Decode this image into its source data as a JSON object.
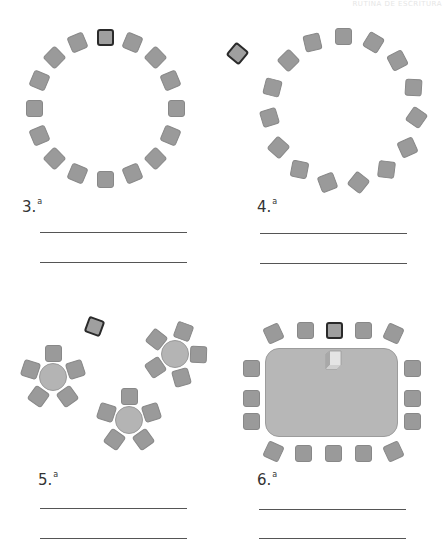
{
  "header": {
    "text": "RUTINA DE ESCRITURA"
  },
  "exercises": [
    {
      "id": "ex3",
      "number": "3.",
      "suffix": "a",
      "arrangement": "circle",
      "seat_count": 16,
      "highlighted_seat": "top"
    },
    {
      "id": "ex4",
      "number": "4.",
      "suffix": "a",
      "arrangement": "circle",
      "seat_count": 15,
      "highlighted_seat": "outside-top-left"
    },
    {
      "id": "ex5",
      "number": "5.",
      "suffix": "a",
      "arrangement": "three-round-tables",
      "seat_count": 15,
      "highlighted_seat": "outside-top"
    },
    {
      "id": "ex6",
      "number": "6.",
      "suffix": "a",
      "arrangement": "rectangular-table",
      "seat_count": 16,
      "highlighted_seat": "top-center"
    }
  ],
  "colors": {
    "seat": "#9a9a9a",
    "highlight_border": "#2a2a2a",
    "table": "#b7b7b7",
    "line": "#555555"
  }
}
